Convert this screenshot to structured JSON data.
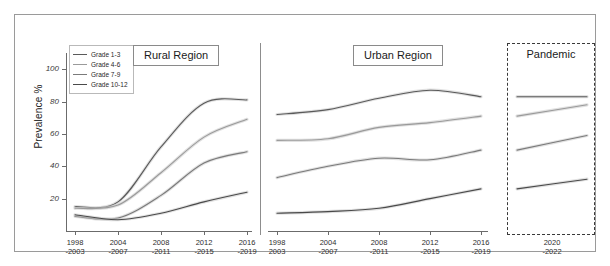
{
  "figure": {
    "ylabel": "Prevalence %",
    "yticks": [
      20,
      40,
      60,
      80,
      100
    ],
    "ylim": [
      0,
      110
    ],
    "legend": [
      {
        "label": "Grade 1-3",
        "color": "#5a5a5a"
      },
      {
        "label": "Grade 4-6",
        "color": "#9a9a9a"
      },
      {
        "label": "Grade 7-9",
        "color": "#7a7a7a"
      },
      {
        "label": "Grade 10-12",
        "color": "#4a4a4a"
      }
    ],
    "panels": [
      {
        "name": "rural",
        "title": "Rural Region",
        "title_box": true
      },
      {
        "name": "urban",
        "title": "Urban Region",
        "title_box": true
      },
      {
        "name": "pandemic",
        "title": "Pandemic",
        "title_box": false,
        "dashed": true
      }
    ]
  },
  "chart_data": [
    {
      "type": "line",
      "title": "Rural Region",
      "xlabel": "",
      "ylabel": "Prevalence %",
      "ylim": [
        0,
        110
      ],
      "grid": false,
      "legend_position": "top-left",
      "categories": [
        "1998\n-2003",
        "2004\n-2007",
        "2008\n-2011",
        "2012\n-2015",
        "2016\n-2019"
      ],
      "x_tick_lines": [
        [
          "1998",
          "-2003"
        ],
        [
          "2004",
          "-2007"
        ],
        [
          "2008",
          "-2011"
        ],
        [
          "2012",
          "-2015"
        ],
        [
          "2016",
          "-2019"
        ]
      ],
      "series": [
        {
          "name": "Grade 1-3",
          "color": "#5a5a5a",
          "values": [
            15,
            18,
            52,
            79,
            81
          ]
        },
        {
          "name": "Grade 4-6",
          "color": "#9a9a9a",
          "values": [
            14,
            16,
            36,
            58,
            69
          ]
        },
        {
          "name": "Grade 7-9",
          "color": "#7a7a7a",
          "values": [
            9,
            8,
            22,
            42,
            49
          ]
        },
        {
          "name": "Grade 10-12",
          "color": "#4a4a4a",
          "values": [
            10,
            7,
            11,
            18,
            24
          ]
        }
      ]
    },
    {
      "type": "line",
      "title": "Urban Region",
      "xlabel": "",
      "ylabel": "",
      "ylim": [
        0,
        110
      ],
      "grid": false,
      "categories": [
        "1998\n2003",
        "2004\n-2007",
        "2008\n-2011",
        "2012\n-2015",
        "2016\n-2019"
      ],
      "x_tick_lines": [
        [
          "1998",
          "2003"
        ],
        [
          "2004",
          "-2007"
        ],
        [
          "2008",
          "-2011"
        ],
        [
          "2012",
          "-2015"
        ],
        [
          "2016",
          "-2019"
        ]
      ],
      "series": [
        {
          "name": "Grade 1-3",
          "color": "#5a5a5a",
          "values": [
            72,
            75,
            82,
            87,
            83
          ]
        },
        {
          "name": "Grade 4-6",
          "color": "#9a9a9a",
          "values": [
            56,
            57,
            64,
            67,
            71
          ]
        },
        {
          "name": "Grade 7-9",
          "color": "#7a7a7a",
          "values": [
            33,
            40,
            45,
            44,
            50
          ]
        },
        {
          "name": "Grade 10-12",
          "color": "#4a4a4a",
          "values": [
            11,
            12,
            14,
            20,
            26
          ]
        }
      ]
    },
    {
      "type": "line",
      "title": "Pandemic",
      "xlabel": "",
      "ylabel": "",
      "ylim": [
        0,
        110
      ],
      "grid": false,
      "categories": [
        "2020\n-2022"
      ],
      "x_tick_lines": [
        [
          "2020",
          "-2022"
        ]
      ],
      "series": [
        {
          "name": "Grade 1-3",
          "color": "#5a5a5a",
          "values": [
            83,
            83
          ]
        },
        {
          "name": "Grade 4-6",
          "color": "#9a9a9a",
          "values": [
            71,
            78
          ]
        },
        {
          "name": "Grade 7-9",
          "color": "#7a7a7a",
          "values": [
            50,
            59
          ]
        },
        {
          "name": "Grade 10-12",
          "color": "#4a4a4a",
          "values": [
            26,
            32
          ]
        }
      ]
    }
  ]
}
